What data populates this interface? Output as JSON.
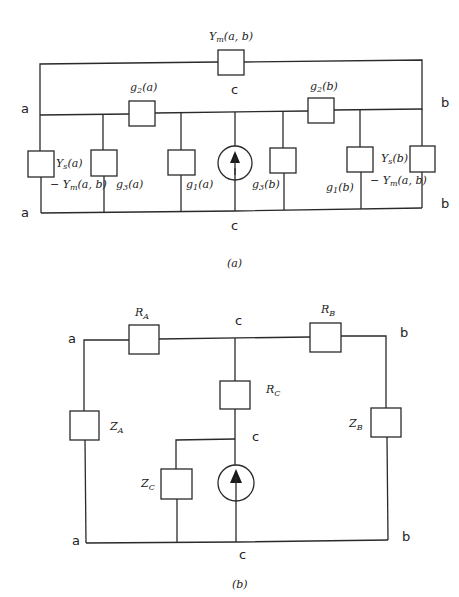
{
  "diagrams": [
    {
      "id": "a",
      "caption": "(a)",
      "nodes": {
        "a_top": "a",
        "a_bottom": "a",
        "b_top": "b",
        "b_bottom": "b",
        "c_top": "c",
        "c_bottom": "c"
      },
      "elements": {
        "ym": "Y",
        "ym_sub": "m",
        "ym_args": "(a, b)",
        "g2a": "g",
        "g2a_sub": "2",
        "g2a_args": "(a)",
        "g2b": "g",
        "g2b_sub": "2",
        "g2b_args": "(b)",
        "ysa": "Y",
        "ysa_sub": "s",
        "ysa_args": "(a)",
        "ysa_minus": "− Y",
        "ysa_minus_sub": "m",
        "ysa_minus_args": "(a, b)",
        "g3a": "g",
        "g3a_sub": "3",
        "g3a_args": "(a)",
        "g1a": "g",
        "g1a_sub": "1",
        "g1a_args": "(a)",
        "g3b": "g",
        "g3b_sub": "3",
        "g3b_args": "(b)",
        "g1b": "g",
        "g1b_sub": "1",
        "g1b_args": "(b)",
        "ysb": "Y",
        "ysb_sub": "s",
        "ysb_args": "(b)",
        "ysb_minus": "− Y",
        "ysb_minus_sub": "m",
        "ysb_minus_args": "(a, b)"
      },
      "source": "current-source-up-arrow-icon"
    },
    {
      "id": "b",
      "caption": "(b)",
      "nodes": {
        "a_top": "a",
        "a_bottom": "a",
        "b_top": "b",
        "b_bottom": "b",
        "c_top": "c",
        "c_mid": "c",
        "c_bottom": "c"
      },
      "elements": {
        "ra": "R",
        "ra_sub": "A",
        "rb": "R",
        "rb_sub": "B",
        "rc": "R",
        "rc_sub": "C",
        "za": "Z",
        "za_sub": "A",
        "zb": "Z",
        "zb_sub": "B",
        "zc": "Z",
        "zc_sub": "C"
      },
      "source": "current-source-up-arrow-icon"
    }
  ],
  "colors": {
    "ink": "#2a2a2a",
    "background": "#ffffff"
  }
}
